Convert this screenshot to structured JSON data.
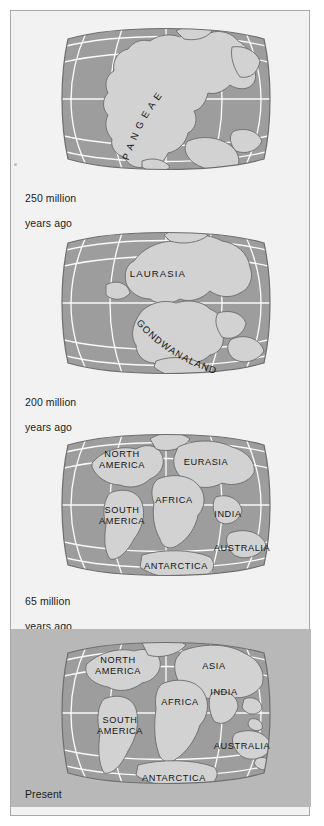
{
  "figure": {
    "projection": "Robinson world map",
    "panel_count": 4,
    "colors": {
      "page_background": "#ffffff",
      "frame_background": "#f2f2f2",
      "frame_border": "#a8a8a8",
      "shaded_panel_background": "#b8b8b8",
      "ocean": "#9d9d9d",
      "land": "#d2d2d2",
      "land_outline": "#6b6b6b",
      "graticule": "#ffffff",
      "text": "#1c1c1c"
    }
  },
  "panels": [
    {
      "id": "panel-250ma",
      "caption": "250 million\nyears ago",
      "caption_line1": "250 million",
      "caption_line2": "years ago",
      "shaded": false,
      "map_labels": [
        {
          "name": "pangaea",
          "text": "P A N G E A E",
          "style": "arc"
        }
      ]
    },
    {
      "id": "panel-200ma",
      "caption": "200 million\nyears ago",
      "caption_line1": "200 million",
      "caption_line2": "years ago",
      "shaded": false,
      "map_labels": [
        {
          "name": "laurasia",
          "text": "LAURASIA",
          "style": "straight"
        },
        {
          "name": "gondwanaland",
          "text": "GONDWANALAND",
          "style": "arc"
        }
      ]
    },
    {
      "id": "panel-65ma",
      "caption": "65 million\nyears ago",
      "caption_line1": "65 million",
      "caption_line2": "years ago",
      "shaded": false,
      "map_labels": [
        {
          "name": "north-america",
          "text": "NORTH AMERICA",
          "line1": "NORTH",
          "line2": "AMERICA"
        },
        {
          "name": "eurasia",
          "text": "EURASIA"
        },
        {
          "name": "africa",
          "text": "AFRICA"
        },
        {
          "name": "south-america",
          "text": "SOUTH AMERICA",
          "line1": "SOUTH",
          "line2": "AMERICA"
        },
        {
          "name": "india",
          "text": "INDIA"
        },
        {
          "name": "australia",
          "text": "AUSTRALIA"
        },
        {
          "name": "antarctica",
          "text": "ANTARCTICA"
        }
      ]
    },
    {
      "id": "panel-present",
      "caption": "Present",
      "caption_line1": "Present",
      "caption_line2": "",
      "shaded": true,
      "map_labels": [
        {
          "name": "north-america",
          "text": "NORTH AMERICA",
          "line1": "NORTH",
          "line2": "AMERICA"
        },
        {
          "name": "asia",
          "text": "ASIA"
        },
        {
          "name": "india",
          "text": "INDIA"
        },
        {
          "name": "africa",
          "text": "AFRICA"
        },
        {
          "name": "south-america",
          "text": "SOUTH AMERICA",
          "line1": "SOUTH",
          "line2": "AMERICA"
        },
        {
          "name": "australia",
          "text": "AUSTRALIA"
        },
        {
          "name": "antarctica",
          "text": "ANTARCTICA"
        }
      ]
    }
  ]
}
